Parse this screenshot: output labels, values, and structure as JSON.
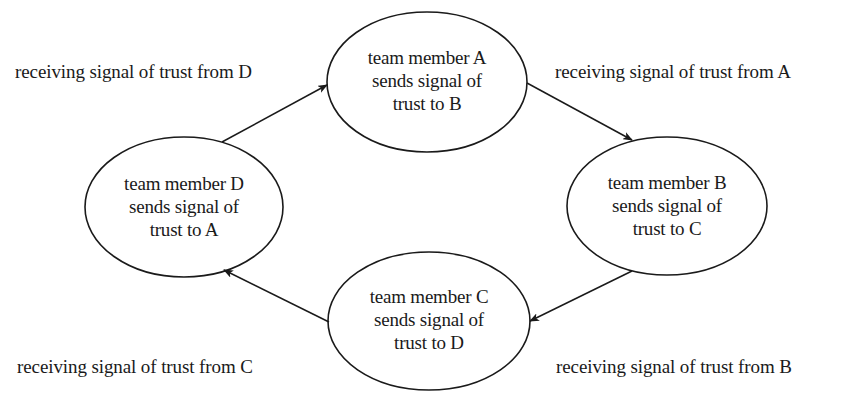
{
  "diagram": {
    "type": "cycle",
    "colors": {
      "stroke": "#1a1a1a",
      "background": "#ffffff",
      "text": "#1a1a1a"
    },
    "nodes": [
      {
        "id": "A",
        "lines": [
          "team member A",
          "sends signal of",
          "trust to B"
        ]
      },
      {
        "id": "B",
        "lines": [
          "team member B",
          "sends signal of",
          "trust to C"
        ]
      },
      {
        "id": "C",
        "lines": [
          "team member C",
          "sends signal of",
          "trust to D"
        ]
      },
      {
        "id": "D",
        "lines": [
          "team member D",
          "sends signal of",
          "trust to A"
        ]
      }
    ],
    "edges": [
      {
        "from": "D",
        "to": "A",
        "label": "receiving signal of trust from D"
      },
      {
        "from": "A",
        "to": "B",
        "label": "receiving signal of trust from A"
      },
      {
        "from": "B",
        "to": "C",
        "label": "receiving signal of trust from B"
      },
      {
        "from": "C",
        "to": "D",
        "label": "receiving signal of trust from C"
      }
    ]
  }
}
